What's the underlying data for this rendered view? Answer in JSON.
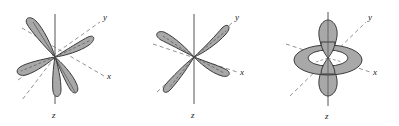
{
  "figure": {
    "background_color": "#ffffff",
    "lobe_fill": "#a8a8a8",
    "lobe_stroke": "#3a3a3a",
    "axis_color": "#555555",
    "dashed_axis_color": "#777777",
    "label_color": "#222222"
  },
  "panels": [
    {
      "id": "panel-1",
      "orbital_name": "d-orbital-four-lobes-tilted",
      "labels": {
        "x": "x",
        "y": "y",
        "z": "z"
      },
      "lobe_count": 4,
      "has_torus": false
    },
    {
      "id": "panel-2",
      "orbital_name": "d-orbital-four-lobes-planar",
      "labels": {
        "x": "x",
        "y": "y",
        "z": "z"
      },
      "lobe_count": 4,
      "has_torus": false
    },
    {
      "id": "panel-3",
      "orbital_name": "dz2-orbital-with-torus",
      "labels": {
        "x": "x",
        "y": "y",
        "z": "z"
      },
      "lobe_count": 2,
      "has_torus": true
    }
  ]
}
